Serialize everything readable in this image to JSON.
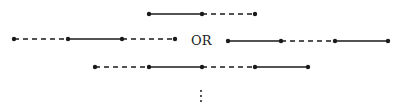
{
  "diagram": {
    "separator_label": "OR",
    "continuation": "⋮",
    "colors": {
      "ink": "#1a1a1a",
      "background": "#ffffff"
    },
    "rows": [
      {
        "id": "row-1",
        "y": 14,
        "points": [
          149,
          202,
          255
        ],
        "segments": [
          "solid",
          "dashed"
        ]
      },
      {
        "id": "row-2-left",
        "y": 39,
        "points": [
          14,
          68,
          122,
          175
        ],
        "segments": [
          "dashed",
          "solid",
          "dashed"
        ]
      },
      {
        "id": "row-2-right",
        "y": 41,
        "points": [
          228,
          281,
          335,
          388
        ],
        "segments": [
          "solid",
          "dashed",
          "solid"
        ]
      },
      {
        "id": "row-3",
        "y": 67,
        "points": [
          95,
          149,
          202,
          255,
          308
        ],
        "segments": [
          "dashed",
          "solid",
          "dashed",
          "solid"
        ]
      }
    ]
  }
}
